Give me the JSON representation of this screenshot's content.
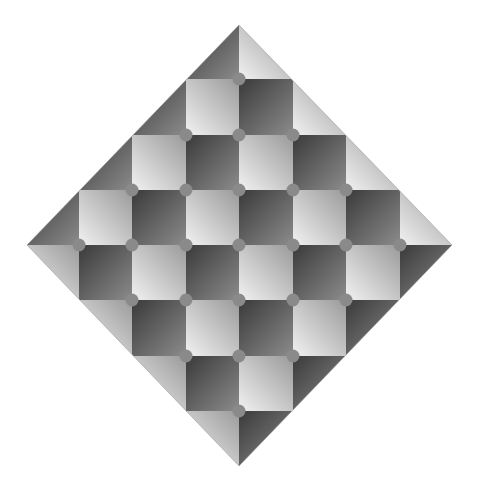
{
  "figure": {
    "background": "#ffffff",
    "diamond": {
      "top": [
        239,
        25
      ],
      "right": [
        452,
        245
      ],
      "bottom": [
        239,
        466
      ],
      "left": [
        27,
        245
      ]
    },
    "grid": {
      "x_edges": [
        25,
        79,
        132,
        186,
        239,
        293,
        346,
        400,
        454
      ],
      "y_edges": [
        24,
        79,
        135,
        190,
        245,
        300,
        356,
        411,
        466
      ]
    },
    "colors": {
      "light_start": "#f2f2f2",
      "light_end": "#9a9a9a",
      "dark_start": "#3a3a3a",
      "dark_end": "#8c8c8c",
      "dot": "#8a8a8a"
    },
    "dot_radius": 6.5,
    "dots": [
      [
        239,
        79
      ],
      [
        186,
        135
      ],
      [
        239,
        135
      ],
      [
        293,
        135
      ],
      [
        132,
        190
      ],
      [
        186,
        190
      ],
      [
        239,
        190
      ],
      [
        293,
        190
      ],
      [
        346,
        190
      ],
      [
        79,
        245
      ],
      [
        132,
        245
      ],
      [
        186,
        245
      ],
      [
        239,
        245
      ],
      [
        293,
        245
      ],
      [
        346,
        245
      ],
      [
        400,
        245
      ],
      [
        132,
        300
      ],
      [
        186,
        300
      ],
      [
        239,
        300
      ],
      [
        293,
        300
      ],
      [
        346,
        300
      ],
      [
        186,
        356
      ],
      [
        239,
        356
      ],
      [
        293,
        356
      ],
      [
        239,
        411
      ]
    ]
  }
}
